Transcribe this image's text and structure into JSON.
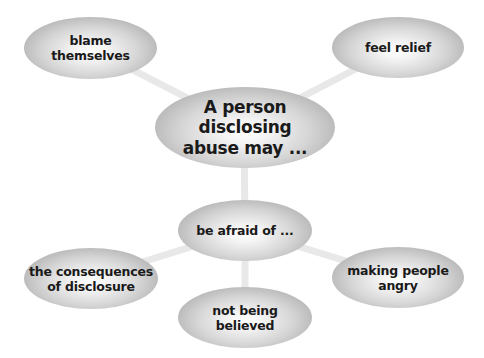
{
  "diagram": {
    "type": "mind-map",
    "central": {
      "label": "A person disclosing abuse may ...",
      "lines": [
        "A person disclosing",
        "abuse may ..."
      ]
    },
    "branches": [
      {
        "id": "blame-themselves",
        "lines": [
          "blame",
          "themselves"
        ]
      },
      {
        "id": "feel-relief",
        "lines": [
          "feel relief"
        ]
      },
      {
        "id": "be-afraid-of",
        "lines": [
          "be afraid of ..."
        ],
        "children": [
          {
            "id": "consequences",
            "lines": [
              "the consequences",
              "of disclosure"
            ]
          },
          {
            "id": "not-believed",
            "lines": [
              "not being",
              "believed"
            ]
          },
          {
            "id": "making-angry",
            "lines": [
              "making people",
              "angry"
            ]
          }
        ]
      }
    ],
    "colors": {
      "node_fill_center": "#ffffff",
      "node_fill_edge": "#9c9c9c",
      "connector": "#e6e6e6",
      "text": "#1a1a1a"
    }
  },
  "nodes": {
    "central": {
      "line1": "A person disclosing",
      "line2": "abuse may ..."
    },
    "blame": {
      "line1": "blame",
      "line2": "themselves"
    },
    "relief": {
      "line1": "feel relief"
    },
    "afraid": {
      "line1": "be afraid of ..."
    },
    "consequences": {
      "line1": "the consequences",
      "line2": "of disclosure"
    },
    "believed": {
      "line1": "not being",
      "line2": "believed"
    },
    "angry": {
      "line1": "making people",
      "line2": "angry"
    }
  }
}
